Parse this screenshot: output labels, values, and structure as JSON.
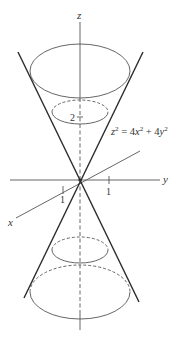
{
  "figure": {
    "type": "double-cone-3d-sketch",
    "equation": {
      "lhs": "z",
      "lhs_exp": "2",
      "eq": " = 4",
      "x": "x",
      "x_exp": "2",
      "plus": " + 4",
      "y": "y",
      "y_exp": "2"
    },
    "axes": {
      "x_label": "x",
      "y_label": "y",
      "z_label": "z"
    },
    "ticks": {
      "x_tick": "1",
      "y_tick": "1",
      "z_tick": "2"
    },
    "colors": {
      "line": "#2a2a2a",
      "thin": "#555555",
      "background": "#ffffff"
    }
  }
}
